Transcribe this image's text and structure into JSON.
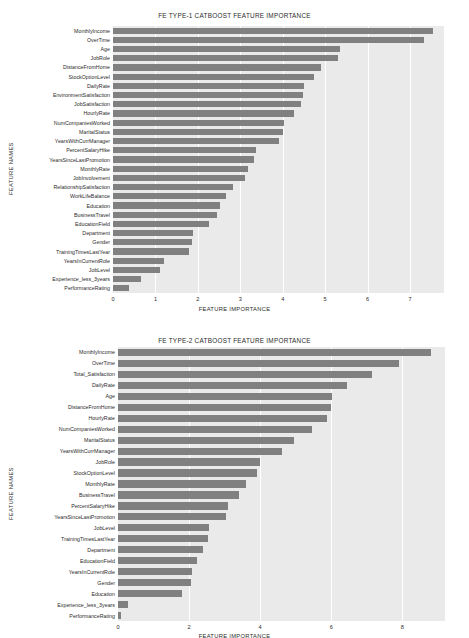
{
  "figure": {
    "background": "#ffffff",
    "bar_color": "#808080",
    "plot_background": "#eaeaea",
    "gridline_color": "#ffffff"
  },
  "chart_data": [
    {
      "type": "bar",
      "orientation": "horizontal",
      "title": "FE TYPE-1 CATBOOST FEATURE IMPORTANCE",
      "xlabel": "FEATURE IMPORTANCE",
      "ylabel": "FEATURE NAMES",
      "xlim": [
        0,
        7.8
      ],
      "xticks": [
        0,
        1,
        2,
        3,
        4,
        5,
        6,
        7
      ],
      "grid": true,
      "legend": null,
      "categories": [
        "MonthlyIncome",
        "OverTime",
        "Age",
        "JobRole",
        "DistanceFromHome",
        "StockOptionLevel",
        "DailyRate",
        "EnvironmentSatisfaction",
        "JobSatisfaction",
        "HourlyRate",
        "NumCompaniesWorked",
        "MaritalStatus",
        "YearsWithCurrManager",
        "PercentSalaryHike",
        "YearsSinceLastPromotion",
        "MonthlyRate",
        "JobInvolvement",
        "RelationshipSatisfaction",
        "WorkLifeBalance",
        "Education",
        "BusinessTravel",
        "EducationField",
        "Department",
        "Gender",
        "TrainingTimesLastYear",
        "YearsInCurrentRole",
        "JobLevel",
        "Experience_less_3years",
        "PerformanceRating"
      ],
      "values": [
        7.55,
        7.32,
        5.36,
        5.3,
        4.9,
        4.74,
        4.5,
        4.47,
        4.42,
        4.26,
        4.03,
        4.0,
        3.92,
        3.36,
        3.32,
        3.18,
        3.12,
        2.82,
        2.66,
        2.51,
        2.46,
        2.26,
        1.88,
        1.85,
        1.8,
        1.2,
        1.1,
        0.67,
        0.38
      ]
    },
    {
      "type": "bar",
      "orientation": "horizontal",
      "title": "FE TYPE-2 CATBOOST FEATURE IMPORTANCE",
      "xlabel": "FEATURE IMPORTANCE",
      "ylabel": "FEATURE NAMES",
      "xlim": [
        0,
        9.2
      ],
      "xticks": [
        0,
        2,
        4,
        6,
        8
      ],
      "grid": true,
      "legend": null,
      "categories": [
        "MonthlyIncome",
        "OverTime",
        "Total_Satisfaction",
        "DailyRate",
        "Age",
        "DistanceFromHome",
        "HourlyRate",
        "NumCompaniesWorked",
        "MaritalStatus",
        "YearsWithCurrManager",
        "JobRole",
        "StockOptionLevel",
        "MonthlyRate",
        "BusinessTravel",
        "PercentSalaryHike",
        "YearsSinceLastPromotion",
        "JobLevel",
        "TrainingTimesLastYear",
        "Department",
        "EducationField",
        "YearsInCurrentRole",
        "Gender",
        "Education",
        "Experience_less_3years",
        "PerformanceRating"
      ],
      "values": [
        8.82,
        7.9,
        7.15,
        6.45,
        6.02,
        6.0,
        5.87,
        5.45,
        4.95,
        4.6,
        4.0,
        3.92,
        3.6,
        3.4,
        3.1,
        3.05,
        2.55,
        2.52,
        2.4,
        2.22,
        2.08,
        2.05,
        1.8,
        0.28,
        0.08
      ]
    }
  ]
}
